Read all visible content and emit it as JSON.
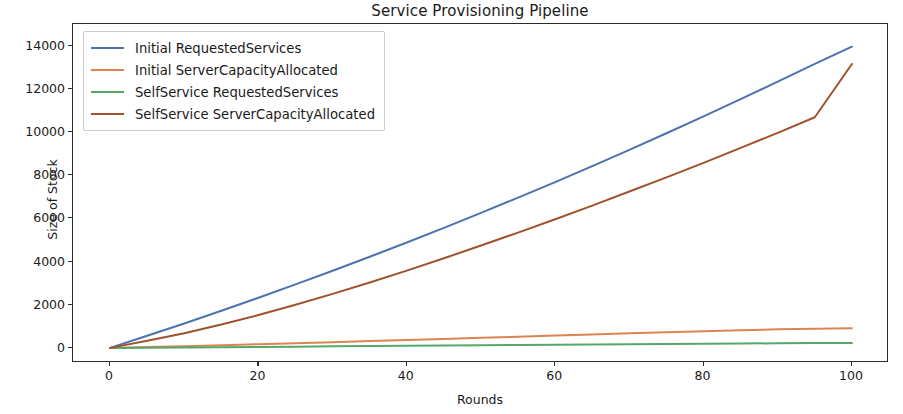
{
  "chart_data": {
    "type": "line",
    "title": "Service Provisioning Pipeline",
    "xlabel": "Rounds",
    "ylabel": "Size of Stock",
    "xlim": [
      -5,
      105
    ],
    "ylim": [
      -700,
      15000
    ],
    "xticks": [
      0,
      20,
      40,
      60,
      80,
      100
    ],
    "yticks": [
      0,
      2000,
      4000,
      6000,
      8000,
      10000,
      12000,
      14000
    ],
    "xtick_labels": [
      "0",
      "20",
      "40",
      "60",
      "80",
      "100"
    ],
    "ytick_labels": [
      "0",
      "2000",
      "4000",
      "6000",
      "8000",
      "10000",
      "12000",
      "14000"
    ],
    "grid": false,
    "legend_position": "upper left",
    "x": [
      0,
      5,
      10,
      15,
      20,
      25,
      30,
      35,
      40,
      45,
      50,
      55,
      60,
      65,
      70,
      75,
      80,
      85,
      90,
      95,
      100
    ],
    "series": [
      {
        "name": "Initial RequestedServices",
        "color": "#4c72b0",
        "values": [
          0,
          560,
          1130,
          1720,
          2320,
          2940,
          3570,
          4220,
          4880,
          5560,
          6250,
          6960,
          7680,
          8420,
          9170,
          9940,
          10720,
          11520,
          12330,
          13150,
          13950
        ]
      },
      {
        "name": "Initial ServerCapacityAllocated",
        "color": "#dd8452",
        "values": [
          0,
          40,
          80,
          125,
          170,
          215,
          265,
          315,
          365,
          415,
          465,
          515,
          570,
          620,
          675,
          725,
          775,
          820,
          860,
          890,
          905
        ]
      },
      {
        "name": "SelfService RequestedServices",
        "color": "#55a868",
        "values": [
          0,
          10,
          22,
          34,
          46,
          58,
          70,
          82,
          95,
          107,
          120,
          132,
          144,
          156,
          168,
          180,
          192,
          203,
          213,
          223,
          232
        ]
      },
      {
        "name": "SelfService ServerCapacityAllocated",
        "color": "#a0522d",
        "values": [
          0,
          330,
          680,
          1080,
          1520,
          2000,
          2500,
          3030,
          3580,
          4150,
          4740,
          5340,
          5960,
          6590,
          7240,
          7900,
          8570,
          9260,
          9960,
          10680,
          13150
        ]
      }
    ]
  },
  "legend": {
    "items": [
      {
        "label": "Initial RequestedServices",
        "color": "#4c72b0"
      },
      {
        "label": "Initial ServerCapacityAllocated",
        "color": "#dd8452"
      },
      {
        "label": "SelfService RequestedServices",
        "color": "#55a868"
      },
      {
        "label": "SelfService ServerCapacityAllocated",
        "color": "#a0522d"
      }
    ]
  }
}
